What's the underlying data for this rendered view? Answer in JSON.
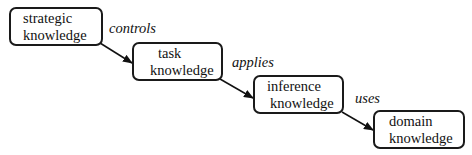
{
  "diagram": {
    "nodes": [
      {
        "id": "strategic",
        "line1": "strategic",
        "line2": "knowledge"
      },
      {
        "id": "task",
        "line1": "task",
        "line2": "knowledge"
      },
      {
        "id": "inference",
        "line1": "inference",
        "line2": "knowledge"
      },
      {
        "id": "domain",
        "line1": "domain",
        "line2": "knowledge"
      }
    ],
    "edges": [
      {
        "from": "strategic",
        "to": "task",
        "label": "controls"
      },
      {
        "from": "task",
        "to": "inference",
        "label": "applies"
      },
      {
        "from": "inference",
        "to": "domain",
        "label": "uses"
      }
    ]
  }
}
